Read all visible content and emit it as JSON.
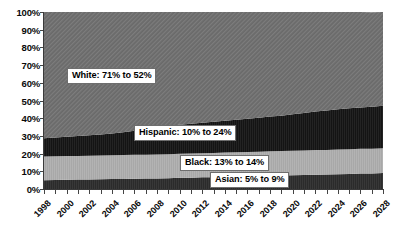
{
  "chart_data": {
    "type": "area",
    "stacked": true,
    "title": "",
    "xlabel": "",
    "ylabel": "",
    "grid": false,
    "legend_position": "inline-callouts",
    "ylim": [
      0,
      100
    ],
    "ytick_labels": [
      "100%",
      "90%",
      "80%",
      "70%",
      "60%",
      "50%",
      "40%",
      "30%",
      "20%",
      "10%",
      "0%"
    ],
    "ytick_values": [
      100,
      90,
      80,
      70,
      60,
      50,
      40,
      30,
      20,
      10,
      0
    ],
    "xlim": [
      1998,
      2028
    ],
    "xtick_labels": [
      "1998",
      "2000",
      "2002",
      "2004",
      "2006",
      "2008",
      "2010",
      "2012",
      "2014",
      "2016",
      "2018",
      "2020",
      "2022",
      "2024",
      "2026",
      "2028"
    ],
    "xtick_values": [
      1998,
      2000,
      2002,
      2004,
      2006,
      2008,
      2010,
      2012,
      2014,
      2016,
      2018,
      2020,
      2022,
      2024,
      2026,
      2028
    ],
    "x": [
      1998,
      1999,
      2000,
      2001,
      2002,
      2003,
      2004,
      2005,
      2006,
      2007,
      2008,
      2009,
      2010,
      2011,
      2012,
      2013,
      2014,
      2015,
      2016,
      2017,
      2018,
      2019,
      2020,
      2021,
      2022,
      2023,
      2024,
      2025,
      2026,
      2027,
      2028
    ],
    "series": [
      {
        "name": "Asian",
        "label": "Asian: 5% to 9%",
        "color": "#2b2b2b",
        "stack_order": 1,
        "values": [
          5.0,
          5.1,
          5.2,
          5.3,
          5.4,
          5.5,
          5.6,
          5.7,
          5.8,
          5.9,
          6.0,
          6.1,
          6.3,
          6.4,
          6.6,
          6.7,
          6.9,
          7.0,
          7.2,
          7.3,
          7.5,
          7.6,
          7.8,
          7.9,
          8.1,
          8.2,
          8.4,
          8.5,
          8.7,
          8.8,
          9.0
        ]
      },
      {
        "name": "Black",
        "label": "Black: 13% to 14%",
        "color": "#a8a8a8",
        "stack_order": 2,
        "values": [
          13.4,
          13.4,
          13.4,
          13.4,
          13.4,
          13.4,
          13.5,
          13.5,
          13.5,
          13.5,
          13.5,
          13.6,
          13.6,
          13.6,
          13.6,
          13.7,
          13.7,
          13.7,
          13.7,
          13.8,
          13.8,
          13.8,
          13.8,
          13.9,
          13.9,
          13.9,
          13.9,
          14.0,
          14.0,
          14.0,
          14.0
        ]
      },
      {
        "name": "Hispanic",
        "label": "Hispanic: 10% to 24%",
        "color": "#141414",
        "stack_order": 3,
        "values": [
          10.3,
          10.6,
          10.9,
          11.2,
          11.6,
          11.9,
          12.3,
          12.8,
          13.6,
          14.6,
          15.3,
          15.9,
          16.4,
          16.8,
          17.2,
          17.6,
          18.0,
          18.4,
          18.8,
          19.2,
          19.6,
          20.0,
          20.6,
          21.2,
          21.8,
          22.3,
          22.8,
          23.1,
          23.4,
          23.7,
          24.0
        ]
      },
      {
        "name": "White",
        "label": "White:  71% to 52%",
        "color": "#6a6a6a",
        "stack_order": 4,
        "values": [
          71.3,
          70.9,
          70.5,
          70.1,
          69.6,
          69.2,
          68.6,
          68.0,
          67.1,
          66.0,
          65.2,
          64.4,
          63.7,
          63.2,
          62.6,
          62.0,
          61.4,
          60.9,
          60.3,
          59.7,
          59.1,
          58.6,
          57.8,
          57.0,
          56.2,
          55.6,
          54.9,
          54.4,
          53.9,
          53.4,
          53.0
        ]
      }
    ],
    "callouts": [
      {
        "name": "white-callout",
        "text": "White:  71% to 52%"
      },
      {
        "name": "hispanic-callout",
        "text": "Hispanic: 10% to 24%"
      },
      {
        "name": "black-callout",
        "text": "Black: 13% to 14%"
      },
      {
        "name": "asian-callout",
        "text": "Asian: 5% to 9%"
      }
    ]
  }
}
